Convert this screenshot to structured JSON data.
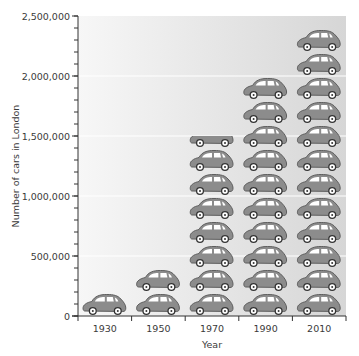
{
  "chart_data": {
    "type": "bar",
    "style": "pictogram",
    "title": "",
    "xlabel": "Year",
    "ylabel": "Number of cars in London",
    "categories": [
      "1930",
      "1950",
      "1970",
      "1990",
      "2010"
    ],
    "values": [
      200000,
      400000,
      1500000,
      2000000,
      2400000
    ],
    "unit_per_icon": 200000,
    "icon": "car-icon",
    "ylim": [
      0,
      2500000
    ],
    "y_major_ticks": [
      0,
      500000,
      1000000,
      1500000,
      2000000,
      2500000
    ],
    "y_tick_labels": [
      "0",
      "500,000",
      "1,000,000",
      "1,500,000",
      "2,000,000",
      "2,500,000"
    ],
    "y_minor_tick_step": 100000,
    "gridlines": [
      500000,
      1000000,
      1500000,
      2000000
    ],
    "grid": true,
    "legend": null
  },
  "colors": {
    "car_body": "#8c8c8c",
    "car_outline": "#5e5e5e",
    "window": "#ffffff",
    "axis": "#333333",
    "grid": "#ffffff",
    "bg_left": "#f7f7f7",
    "bg_right": "#d6d6d6"
  }
}
